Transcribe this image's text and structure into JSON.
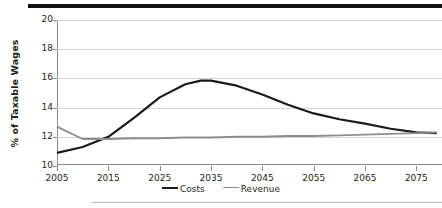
{
  "figure": {
    "top_rule_color": "#111111",
    "bottom_rule_color": "#b9b6b4"
  },
  "chart_data": {
    "type": "line",
    "title": "",
    "xlabel": "",
    "ylabel": "% of Taxable Wages",
    "xlim": [
      2005,
      2080
    ],
    "ylim": [
      10,
      20
    ],
    "yticks": [
      10,
      12,
      14,
      16,
      18,
      20
    ],
    "xticks": [
      2005,
      2015,
      2025,
      2035,
      2045,
      2055,
      2065,
      2075
    ],
    "grid": true,
    "grid_color": "#d6d3d1",
    "legend_position": "bottom-center",
    "x": [
      2005,
      2010,
      2015,
      2020,
      2025,
      2030,
      2033,
      2035,
      2040,
      2045,
      2050,
      2055,
      2060,
      2065,
      2070,
      2075,
      2079
    ],
    "series": [
      {
        "name": "Costs",
        "color": "#1a1a1a",
        "width": 2.2,
        "values": [
          10.9,
          11.3,
          12.0,
          13.3,
          14.7,
          15.6,
          15.85,
          15.85,
          15.5,
          14.9,
          14.2,
          13.6,
          13.2,
          12.9,
          12.55,
          12.3,
          12.25
        ]
      },
      {
        "name": "Revenue",
        "color": "#8f8d8c",
        "width": 1.9,
        "values": [
          12.7,
          11.85,
          11.85,
          11.9,
          11.9,
          11.95,
          11.95,
          11.95,
          12.0,
          12.0,
          12.05,
          12.05,
          12.1,
          12.15,
          12.2,
          12.25,
          12.3
        ]
      }
    ]
  },
  "legend": {
    "items": [
      {
        "label": "Costs",
        "color": "#1a1a1a"
      },
      {
        "label": "Revenue",
        "color": "#8f8d8c"
      }
    ]
  }
}
